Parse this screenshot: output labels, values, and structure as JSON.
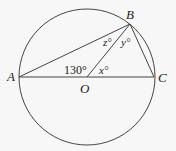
{
  "diagram": {
    "type": "circle-geometry",
    "center": {
      "label": "O",
      "x": 87,
      "y": 77
    },
    "radius": 68,
    "points": {
      "A": {
        "label": "A",
        "x": 19,
        "y": 77
      },
      "B": {
        "label": "B",
        "x": 130,
        "y": 24
      },
      "C": {
        "label": "C",
        "x": 154,
        "y": 77
      }
    },
    "angles": {
      "AOB": "130°",
      "BOC": "x°",
      "OBC": "y°",
      "ABO": "z°"
    },
    "line_color": "#444444"
  }
}
